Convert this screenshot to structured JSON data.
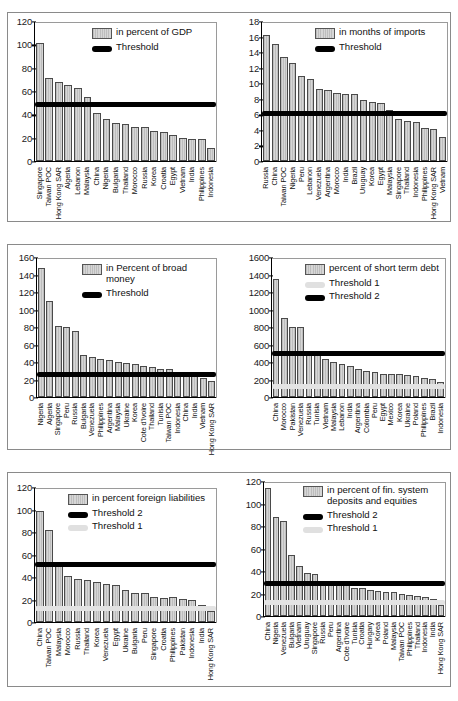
{
  "figure": {
    "panel_count": 6,
    "bar_color": "#c9c9c9",
    "threshold_dark_color": "#000000",
    "threshold_light_color": "#e3e3e3"
  },
  "chart_data": [
    {
      "id": "reserves-percent-gdp",
      "type": "bar",
      "title": "",
      "xlabel": "",
      "ylabel": "",
      "ylim": [
        0,
        120
      ],
      "yticks": [
        0,
        20,
        40,
        60,
        80,
        100,
        120
      ],
      "grid": false,
      "legend_position": "top-right",
      "legend": [
        {
          "label": "in percent of GDP",
          "key": "bar"
        },
        {
          "label": "Threshold",
          "key": "dark"
        }
      ],
      "thresholds": [
        {
          "name": "Threshold",
          "value": 49,
          "style": "dark"
        }
      ],
      "categories": [
        "Singapore",
        "Taiwan POC",
        "Hong Kong SAR",
        "Algeria",
        "Lebanon",
        "Malaysia",
        "China",
        "Nigeria",
        "Bulgaria",
        "Thailand",
        "Morocco",
        "Russia",
        "Korea",
        "Croatia",
        "Egypt",
        "Vietnam",
        "India",
        "Philippines",
        "Indonesia"
      ],
      "values": [
        101,
        71,
        68,
        65,
        62.5,
        54.5,
        41,
        36,
        32.5,
        31.5,
        29,
        29.5,
        26,
        24.5,
        22,
        20,
        19,
        19,
        11.5
      ]
    },
    {
      "id": "reserves-months-imports",
      "type": "bar",
      "title": "",
      "xlabel": "",
      "ylabel": "",
      "ylim": [
        0,
        18
      ],
      "yticks": [
        0,
        2,
        4,
        6,
        8,
        10,
        12,
        14,
        16,
        18
      ],
      "grid": false,
      "legend_position": "top-right",
      "legend": [
        {
          "label": "in months of imports",
          "key": "bar"
        },
        {
          "label": "Threshold",
          "key": "dark"
        }
      ],
      "thresholds": [
        {
          "name": "Threshold",
          "value": 6.2,
          "style": "dark"
        }
      ],
      "categories": [
        "Russia",
        "China",
        "Taiwan POC",
        "Nigeria",
        "Peru",
        "Lebanon",
        "Venezuela",
        "Argentina",
        "Morocco",
        "India",
        "Brazil",
        "Uruguay",
        "Korea",
        "Egypt",
        "Malaysia",
        "Singapore",
        "Thailand",
        "Indonesia",
        "Philippines",
        "Hong Kong SAR",
        "Vietnam"
      ],
      "values": [
        16.2,
        15.1,
        13.4,
        12.6,
        10.9,
        10.6,
        9.2,
        9.1,
        8.7,
        8.6,
        8.6,
        7.8,
        7.6,
        7.4,
        6.6,
        5.4,
        5.2,
        5.0,
        4.2,
        4.1,
        3.1
      ]
    },
    {
      "id": "reserves-percent-broad-money",
      "type": "bar",
      "title": "",
      "xlabel": "",
      "ylabel": "",
      "ylim": [
        0,
        160
      ],
      "yticks": [
        0,
        20,
        40,
        60,
        80,
        100,
        120,
        140,
        160
      ],
      "grid": false,
      "legend_position": "top-right",
      "legend": [
        {
          "label": "in Percent of broad money",
          "key": "bar"
        },
        {
          "label": "Threshold",
          "key": "dark"
        }
      ],
      "thresholds": [
        {
          "name": "Threshold",
          "value": 27,
          "style": "dark"
        }
      ],
      "categories": [
        "Nigeria",
        "Algeria",
        "Singapore",
        "Peru",
        "Russia",
        "Bulgaria",
        "Venezuela",
        "Philippines",
        "Argentina",
        "Malaysia",
        "Ukraine",
        "Korea",
        "Cote d'Ivoire",
        "Thailand",
        "Tunisia",
        "Taiwan POC",
        "Indonesia",
        "China",
        "India",
        "Vietnam",
        "Hong Kong SAR"
      ],
      "values": [
        147,
        110,
        81,
        80.5,
        75,
        47.5,
        45.5,
        44,
        42.5,
        40,
        39,
        37.5,
        35.5,
        34,
        32.5,
        32,
        27,
        26.5,
        25.5,
        21.5,
        18.5
      ]
    },
    {
      "id": "reserves-percent-short-term-debt",
      "type": "bar",
      "title": "",
      "xlabel": "",
      "ylabel": "",
      "ylim": [
        0,
        1600
      ],
      "yticks": [
        0,
        200,
        400,
        600,
        800,
        1000,
        1200,
        1400,
        1600
      ],
      "grid": false,
      "legend_position": "top-right",
      "legend": [
        {
          "label": "percent of short term debt",
          "key": "bar"
        },
        {
          "label": "Threshold 1",
          "key": "light"
        },
        {
          "label": "Threshold 2",
          "key": "dark"
        }
      ],
      "thresholds": [
        {
          "name": "Threshold 1",
          "value": 130,
          "style": "light"
        },
        {
          "name": "Threshold 2",
          "value": 510,
          "style": "dark"
        }
      ],
      "categories": [
        "China",
        "Morocco",
        "Pakistan",
        "Venezuela",
        "Russia",
        "Tunisia",
        "Vietnam",
        "Malaysia",
        "Lebanon",
        "India",
        "Argentina",
        "Colombia",
        "Peru",
        "Egypt",
        "Mexico",
        "Korea",
        "Ukraine",
        "Poland",
        "Philippines",
        "Brazil",
        "Indonesia"
      ],
      "values": [
        1345,
        900,
        800,
        798,
        500,
        490,
        430,
        405,
        378,
        360,
        325,
        293,
        283,
        268,
        262,
        258,
        255,
        235,
        215,
        205,
        170
      ]
    },
    {
      "id": "reserves-percent-foreign-liabilities",
      "type": "bar",
      "title": "",
      "xlabel": "",
      "ylabel": "",
      "ylim": [
        0,
        120
      ],
      "yticks": [
        0,
        20,
        40,
        60,
        80,
        100,
        120
      ],
      "grid": false,
      "legend_position": "top-right",
      "legend": [
        {
          "label": "in percent foreign liabilities",
          "key": "bar"
        },
        {
          "label": "Threshold 2",
          "key": "dark"
        },
        {
          "label": "Threshold 1",
          "key": "light"
        }
      ],
      "thresholds": [
        {
          "name": "Threshold 1",
          "value": 13,
          "style": "light"
        },
        {
          "name": "Threshold 2",
          "value": 52,
          "style": "dark"
        }
      ],
      "categories": [
        "China",
        "Taiwan POC",
        "Malaysia",
        "Morocco",
        "Russia",
        "Thailand",
        "Korea",
        "Venezuela",
        "Egypt",
        "Ukraine",
        "Bulgaria",
        "Peru",
        "Singapore",
        "Croatia",
        "Philippines",
        "Pakistan",
        "Indonesia",
        "India",
        "Hong Kong SAR"
      ],
      "values": [
        99,
        82,
        51,
        40.5,
        38.5,
        37,
        36,
        34,
        32.5,
        28.5,
        26,
        25.5,
        22.5,
        21.5,
        22,
        20.5,
        19.5,
        15.5,
        9.5
      ]
    },
    {
      "id": "reserves-percent-fin-system-deposits-equities",
      "type": "bar",
      "title": "",
      "xlabel": "",
      "ylabel": "",
      "ylim": [
        0,
        120
      ],
      "yticks": [
        0,
        20,
        40,
        60,
        80,
        100,
        120
      ],
      "grid": false,
      "legend_position": "top-right",
      "legend": [
        {
          "label": "in percent of fin. system\ndeposits and equities",
          "key": "bar"
        },
        {
          "label": "Threshold 2",
          "key": "dark"
        },
        {
          "label": "Threshold 1",
          "key": "light"
        }
      ],
      "thresholds": [
        {
          "name": "Threshold 1",
          "value": 13,
          "style": "light"
        },
        {
          "name": "Threshold 2",
          "value": 30,
          "style": "dark"
        }
      ],
      "categories": [
        "China",
        "Nigeria",
        "Venezuela",
        "Bulgaria",
        "Vietnam",
        "Uruguay",
        "Singapore",
        "Russia",
        "Peru",
        "Argentina",
        "Cote d'Ivoire",
        "Tunisia",
        "Croatia",
        "Hungary",
        "Korea",
        "Poland",
        "Malaysia",
        "Taiwan POC",
        "Philippines",
        "Thailand",
        "Indonesia",
        "India",
        "Hong Kong SAR"
      ],
      "values": [
        113.5,
        88,
        84.5,
        54,
        44.5,
        38.5,
        37.5,
        30,
        30,
        29.5,
        28,
        24.5,
        24.5,
        23,
        22,
        21.5,
        21,
        19.5,
        18.5,
        17.5,
        17,
        15.5,
        9.5
      ]
    }
  ]
}
